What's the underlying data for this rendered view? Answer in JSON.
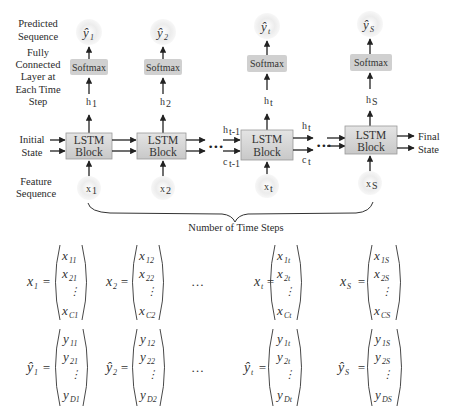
{
  "labels": {
    "predicted_sequence": [
      "Predicted",
      "Sequence"
    ],
    "fully_connected": [
      "Fully",
      "Connected",
      "Layer at",
      "Each Time",
      "Step"
    ],
    "initial_state": [
      "Initial",
      "State"
    ],
    "final_state": [
      "Final",
      "State"
    ],
    "feature_sequence": [
      "Feature",
      "Sequence"
    ],
    "number_of_time_steps": "Number of Time Steps"
  },
  "columns": [
    {
      "output": "ŷ",
      "output_sub": "1",
      "softmax": "Softmax",
      "hidden": "h",
      "hidden_sub": "1",
      "block": [
        "LSTM",
        "Block"
      ],
      "input": "x",
      "input_sub": "1"
    },
    {
      "output": "ŷ",
      "output_sub": "2",
      "softmax": "Softmax",
      "hidden": "h",
      "hidden_sub": "2",
      "block": [
        "LSTM",
        "Block"
      ],
      "input": "x",
      "input_sub": "2"
    },
    {
      "output": "ŷ",
      "output_sub": "t",
      "softmax": "Softmax",
      "hidden": "h",
      "hidden_sub": "t",
      "block": [
        "LSTM",
        "Block"
      ],
      "input": "x",
      "input_sub": "t"
    },
    {
      "output": "ŷ",
      "output_sub": "S",
      "softmax": "Softmax",
      "hidden": "h",
      "hidden_sub": "S",
      "block": [
        "LSTM",
        "Block"
      ],
      "input": "x",
      "input_sub": "S"
    }
  ],
  "state_labels": {
    "h_prev": "h",
    "h_prev_sub": "t-1",
    "c_prev": "c",
    "c_prev_sub": "t-1",
    "h_t": "h",
    "h_t_sub": "t",
    "c_t": "c",
    "c_t_sub": "t"
  },
  "ellipsis": "•••",
  "equations": {
    "x_vectors": [
      {
        "lhs": "x",
        "lhs_sub": "1",
        "entries": [
          [
            "x",
            "11"
          ],
          [
            "x",
            "21"
          ],
          [
            "⋮",
            ""
          ],
          [
            "x",
            "C1"
          ]
        ]
      },
      {
        "lhs": "x",
        "lhs_sub": "2",
        "entries": [
          [
            "x",
            "12"
          ],
          [
            "x",
            "22"
          ],
          [
            "⋮",
            ""
          ],
          [
            "x",
            "C2"
          ]
        ]
      },
      {
        "lhs": "x",
        "lhs_sub": "t",
        "entries": [
          [
            "x",
            "1t"
          ],
          [
            "x",
            "2t"
          ],
          [
            "⋮",
            ""
          ],
          [
            "x",
            "Ct"
          ]
        ]
      },
      {
        "lhs": "x",
        "lhs_sub": "S",
        "entries": [
          [
            "x",
            "1S"
          ],
          [
            "x",
            "2S"
          ],
          [
            "⋮",
            ""
          ],
          [
            "x",
            "CS"
          ]
        ]
      }
    ],
    "y_vectors": [
      {
        "lhs": "ŷ",
        "lhs_sub": "1",
        "entries": [
          [
            "y",
            "11"
          ],
          [
            "y",
            "21"
          ],
          [
            "⋮",
            ""
          ],
          [
            "y",
            "D1"
          ]
        ]
      },
      {
        "lhs": "ŷ",
        "lhs_sub": "2",
        "entries": [
          [
            "y",
            "12"
          ],
          [
            "y",
            "22"
          ],
          [
            "⋮",
            ""
          ],
          [
            "y",
            "D2"
          ]
        ]
      },
      {
        "lhs": "ŷ",
        "lhs_sub": "t",
        "entries": [
          [
            "y",
            "1t"
          ],
          [
            "y",
            "2t"
          ],
          [
            "⋮",
            ""
          ],
          [
            "y",
            "Dt"
          ]
        ]
      },
      {
        "lhs": "ŷ",
        "lhs_sub": "S",
        "entries": [
          [
            "y",
            "1S"
          ],
          [
            "y",
            "2S"
          ],
          [
            "⋮",
            ""
          ],
          [
            "y",
            "DS"
          ]
        ]
      }
    ],
    "ellipsis": "…",
    "equals": "="
  },
  "colors": {
    "block_fill": "#d6d6d6",
    "softmax_fill": "#d0d0d0",
    "node_fill": "#e6e6e6",
    "arrow": "#222222",
    "text": "#2a2a2a"
  }
}
